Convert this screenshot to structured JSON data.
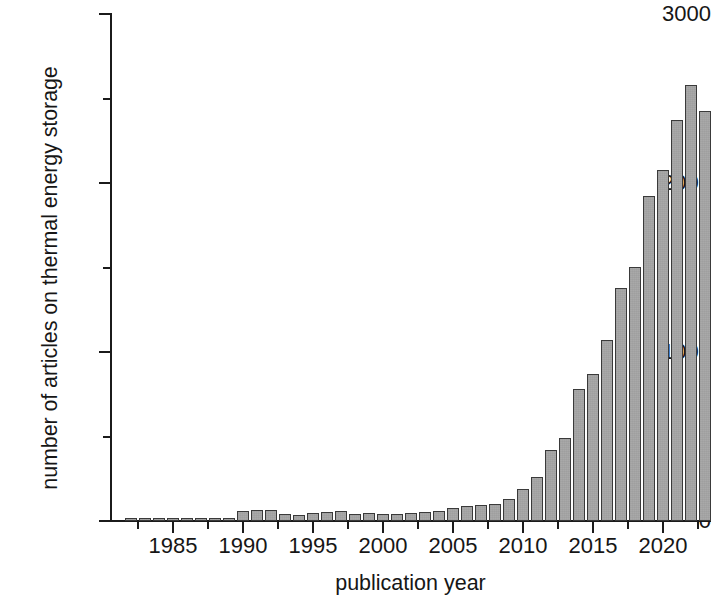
{
  "chart_data": {
    "type": "bar",
    "title": "",
    "subtitle": "",
    "xlabel": "publication year",
    "ylabel": "number of articles on thermal energy storage",
    "xlim": [
      1981.3,
      1981.3
    ],
    "ylim": [
      0,
      3000
    ],
    "grid": false,
    "legend": null,
    "y_ticks_major": [
      0,
      1000,
      2000,
      3000
    ],
    "y_ticks_minor": [
      500,
      1500,
      2500
    ],
    "x_ticks_major": [
      1985,
      1990,
      1995,
      2000,
      2005,
      2010,
      2015,
      2020
    ],
    "x_ticks_minor": [
      1982.5,
      1987.5,
      1992.5,
      1997.5,
      2002.5,
      2007.5,
      2012.5,
      2017.5,
      2022.5
    ],
    "x_tick_labels": [
      "1985",
      "1990",
      "1995",
      "2000",
      "2005",
      "2010",
      "2015",
      "2020"
    ],
    "y_tick_labels": [
      "0",
      "1000",
      "2000",
      "3000"
    ],
    "bar_color": "#a9a9a9",
    "bar_edge_color": "#3a3a3a",
    "axis_color": "#1b1b1b",
    "background": "#ffffff",
    "categories": [
      1982,
      1983,
      1984,
      1985,
      1986,
      1987,
      1988,
      1989,
      1990,
      1991,
      1992,
      1993,
      1994,
      1995,
      1996,
      1997,
      1998,
      1999,
      2000,
      2001,
      2002,
      2003,
      2004,
      2005,
      2006,
      2007,
      2008,
      2009,
      2010,
      2011,
      2012,
      2013,
      2014,
      2015,
      2016,
      2017,
      2018,
      2019,
      2020,
      2021,
      2022,
      2023
    ],
    "values": [
      8,
      12,
      15,
      18,
      14,
      16,
      12,
      20,
      62,
      68,
      66,
      42,
      38,
      46,
      52,
      58,
      44,
      48,
      42,
      40,
      46,
      52,
      62,
      78,
      86,
      96,
      100,
      128,
      190,
      262,
      418,
      492,
      782,
      872,
      1070,
      1380,
      1505,
      1925,
      2075,
      2370,
      2580,
      2425
    ]
  }
}
